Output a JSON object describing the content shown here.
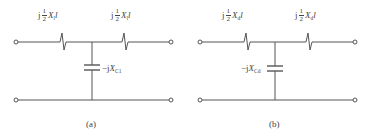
{
  "figure": {
    "panels": [
      {
        "id": "a",
        "caption": "(a)",
        "series_left": {
          "prefix": "j",
          "frac_num": "1",
          "frac_den": "2",
          "symbol": "X",
          "sub": "l",
          "suffix": "l"
        },
        "series_right": {
          "prefix": "j",
          "frac_num": "1",
          "frac_den": "2",
          "symbol": "X",
          "sub": "l",
          "suffix": "l"
        },
        "shunt": {
          "prefix": "−j",
          "symbol": "X",
          "sub": "C1",
          "label_side": "right"
        }
      },
      {
        "id": "b",
        "caption": "(b)",
        "series_left": {
          "prefix": "j",
          "frac_num": "1",
          "frac_den": "2",
          "symbol": "X",
          "sub": "d",
          "suffix": "l"
        },
        "series_right": {
          "prefix": "j",
          "frac_num": "1",
          "frac_den": "2",
          "symbol": "X",
          "sub": "d",
          "suffix": "l"
        },
        "shunt": {
          "prefix": "−j",
          "symbol": "X",
          "sub": "Cd",
          "label_side": "left"
        }
      }
    ],
    "colors": {
      "wire": "#555555",
      "text": "#444444"
    }
  }
}
